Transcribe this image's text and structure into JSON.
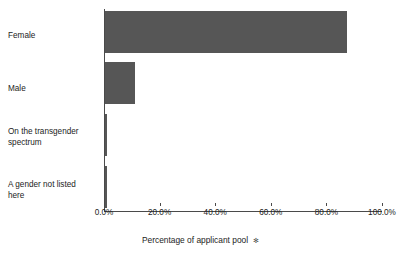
{
  "chart_data": {
    "type": "bar",
    "orientation": "horizontal",
    "title": "",
    "xlabel": "Percentage of applicant pool",
    "ylabel": "",
    "categories": [
      "Female",
      "Male",
      "On the transgender spectrum",
      "A gender not listed here"
    ],
    "values": [
      87.0,
      10.8,
      0.6,
      0.6
    ],
    "xlim": [
      0,
      100
    ],
    "xticks": [
      0,
      20,
      40,
      60,
      80,
      100
    ],
    "xtick_labels": [
      "0.0%",
      "20.0%",
      "40.0%",
      "60.0%",
      "80.0%",
      "100.0%"
    ],
    "grid": false,
    "legend": false,
    "bar_color": "#565656",
    "axis_color": "#4a4a4a",
    "background": "#ffffff"
  },
  "axis": {
    "title_text": "Percentage of applicant pool",
    "title_marker": "✻"
  },
  "category_labels": [
    "Female",
    "Male",
    "On the transgender\nspectrum",
    "A gender not listed\nhere"
  ]
}
